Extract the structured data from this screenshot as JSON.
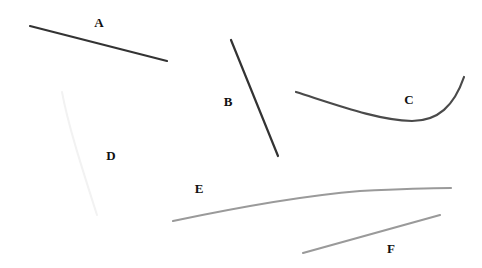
{
  "figure": {
    "width": 482,
    "height": 268,
    "background_color": "#ffffff",
    "title": "",
    "labels": [
      {
        "text": "A",
        "x": 99,
        "y": 22
      },
      {
        "text": "B",
        "x": 228,
        "y": 101
      },
      {
        "text": "C",
        "x": 409,
        "y": 99
      },
      {
        "text": "D",
        "x": 111,
        "y": 155
      },
      {
        "text": "E",
        "x": 199,
        "y": 188
      },
      {
        "text": "F",
        "x": 391,
        "y": 248
      }
    ]
  },
  "chart_data": {
    "type": "line",
    "title": "",
    "xlabel": "",
    "ylabel": "",
    "xlim": [
      0,
      482
    ],
    "ylim": [
      268,
      0
    ],
    "grid": false,
    "legend": "none",
    "axes_visible": false,
    "annotations": [
      {
        "label": "A",
        "x": 99,
        "y": 22
      },
      {
        "label": "B",
        "x": 228,
        "y": 101
      },
      {
        "label": "C",
        "x": 409,
        "y": 99
      },
      {
        "label": "D",
        "x": 111,
        "y": 155
      },
      {
        "label": "E",
        "x": 199,
        "y": 188
      },
      {
        "label": "F",
        "x": 391,
        "y": 248
      }
    ],
    "series": [
      {
        "name": "A",
        "shape": "straight-line",
        "color": "#333333",
        "linewidth": 2.2,
        "path": "M 30 26 L 167 61",
        "points": [
          [
            30,
            26
          ],
          [
            167,
            61
          ]
        ]
      },
      {
        "name": "B",
        "shape": "straight-line",
        "color": "#333333",
        "linewidth": 2.2,
        "path": "M 231 40 L 278 156",
        "points": [
          [
            231,
            40
          ],
          [
            278,
            156
          ]
        ]
      },
      {
        "name": "C",
        "shape": "curve-convex-upturn",
        "color": "#4a4a4a",
        "linewidth": 2.2,
        "path": "M 296 92 C 340 106, 378 120, 412 121 C 438 121, 454 106, 464 77",
        "points": [
          [
            296,
            92
          ],
          [
            340,
            106
          ],
          [
            378,
            118
          ],
          [
            412,
            121
          ],
          [
            438,
            116
          ],
          [
            455,
            101
          ],
          [
            464,
            77
          ]
        ]
      },
      {
        "name": "D",
        "shape": "curve-faint",
        "color": "#f2f2f2",
        "linewidth": 2.0,
        "path": "M 62 92 C 68 125, 82 168, 97 215",
        "points": [
          [
            62,
            92
          ],
          [
            70,
            130
          ],
          [
            82,
            170
          ],
          [
            97,
            215
          ]
        ]
      },
      {
        "name": "E",
        "shape": "curve-concave-down",
        "color": "#9a9a9a",
        "linewidth": 2.2,
        "path": "M 173 221 C 230 209, 300 196, 360 191 C 400 189, 430 188, 451 188",
        "points": [
          [
            173,
            221
          ],
          [
            230,
            208
          ],
          [
            300,
            196
          ],
          [
            360,
            191
          ],
          [
            410,
            189
          ],
          [
            451,
            188
          ]
        ]
      },
      {
        "name": "F",
        "shape": "straight-line",
        "color": "#9a9a9a",
        "linewidth": 2.2,
        "path": "M 303 253 L 440 215",
        "points": [
          [
            303,
            253
          ],
          [
            440,
            215
          ]
        ]
      }
    ]
  }
}
